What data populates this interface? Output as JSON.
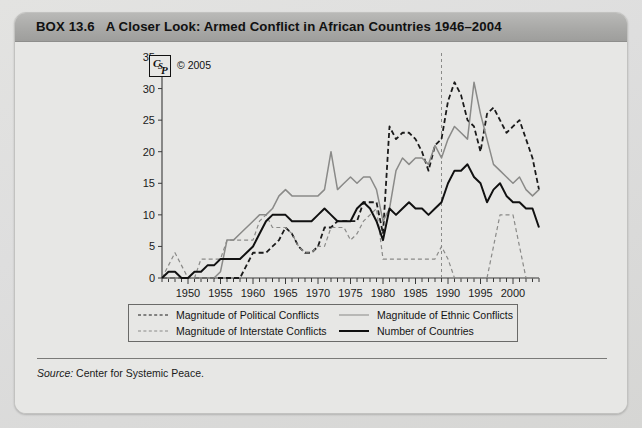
{
  "box": {
    "label": "BOX 13.6",
    "title": "A Closer Look: Armed Conflict in African Countries 1946–2004"
  },
  "logo": {
    "mark_c": "C",
    "mark_s": "S",
    "mark_p": "P",
    "copyright": "© 2005"
  },
  "source": {
    "prefix": "Source:",
    "text": " Center for Systemic Peace."
  },
  "legend": {
    "items": [
      {
        "label": "Magnitude of Political Conflicts",
        "style": "dashed-black"
      },
      {
        "label": "Magnitude of Ethnic Conflicts",
        "style": "solid-gray"
      },
      {
        "label": "Magnitude of Interstate Conflicts",
        "style": "dashed-gray"
      },
      {
        "label": "Number of Countries",
        "style": "solid-black"
      }
    ]
  },
  "colors": {
    "black": "#111111",
    "gray": "#8a8a88",
    "axis": "#3a3a3a",
    "header_band": "#a9a9a7",
    "page_bg": "#e7e7e5"
  },
  "chart_data": {
    "type": "line",
    "xlabel": "",
    "ylabel": "",
    "xlim": [
      1946,
      2004
    ],
    "ylim": [
      0,
      35
    ],
    "yticks": [
      0,
      5,
      10,
      15,
      20,
      25,
      30,
      35
    ],
    "xticks": [
      1950,
      1955,
      1960,
      1965,
      1970,
      1975,
      1980,
      1985,
      1990,
      1995,
      2000
    ],
    "xtick_step_minor": 1,
    "grid": false,
    "legend_position": "below-plot",
    "annotations": [
      {
        "type": "vline",
        "x": 1989,
        "style": "dashed",
        "color": "#8a8a88",
        "label": ""
      }
    ],
    "x": [
      1946,
      1947,
      1948,
      1949,
      1950,
      1951,
      1952,
      1953,
      1954,
      1955,
      1956,
      1957,
      1958,
      1959,
      1960,
      1961,
      1962,
      1963,
      1964,
      1965,
      1966,
      1967,
      1968,
      1969,
      1970,
      1971,
      1972,
      1973,
      1974,
      1975,
      1976,
      1977,
      1978,
      1979,
      1980,
      1981,
      1982,
      1983,
      1984,
      1985,
      1986,
      1987,
      1988,
      1989,
      1990,
      1991,
      1992,
      1993,
      1994,
      1995,
      1996,
      1997,
      1998,
      1999,
      2000,
      2001,
      2002,
      2003,
      2004
    ],
    "series": [
      {
        "name": "Magnitude of Political Conflicts",
        "style": "dashed",
        "color": "#1a1a1a",
        "width": 1.8,
        "values": [
          0,
          0,
          0,
          0,
          0,
          0,
          0,
          0,
          0,
          0,
          0,
          0,
          0,
          2,
          4,
          4,
          4,
          5,
          6,
          8,
          7,
          5,
          4,
          4,
          5,
          8,
          8,
          9,
          9,
          9,
          9,
          12,
          12,
          12,
          7,
          24,
          22,
          23,
          23,
          22,
          20,
          17,
          21,
          22,
          28,
          31,
          29,
          25,
          24,
          20,
          26,
          27,
          25,
          23,
          24,
          25,
          22,
          19,
          14
        ]
      },
      {
        "name": "Magnitude of Ethnic Conflicts",
        "style": "solid",
        "color": "#8a8a88",
        "width": 1.5,
        "values": [
          0,
          0,
          0,
          0,
          0,
          0,
          0,
          0,
          0,
          1,
          6,
          6,
          7,
          8,
          9,
          10,
          10,
          11,
          13,
          14,
          13,
          13,
          13,
          13,
          13,
          14,
          20,
          14,
          15,
          16,
          15,
          16,
          16,
          14,
          9,
          11,
          17,
          19,
          18,
          19,
          19,
          18,
          21,
          19,
          22,
          24,
          23,
          22,
          31,
          26,
          22,
          18,
          17,
          16,
          15,
          16,
          14,
          13,
          14
        ]
      },
      {
        "name": "Magnitude of Interstate Conflicts",
        "style": "dashed",
        "color": "#8a8a88",
        "width": 1.2,
        "values": [
          0,
          2,
          4,
          2,
          0,
          0,
          3,
          3,
          3,
          3,
          6,
          6,
          6,
          6,
          6,
          9,
          10,
          8,
          8,
          8,
          7,
          5,
          4,
          4,
          5,
          5,
          8,
          8,
          8,
          6,
          7,
          9,
          10,
          11,
          3,
          3,
          3,
          3,
          3,
          3,
          3,
          3,
          3,
          5,
          3,
          0,
          0,
          0,
          0,
          0,
          0,
          5,
          10,
          10,
          10,
          5,
          0,
          0,
          0
        ]
      },
      {
        "name": "Number of Countries",
        "style": "solid",
        "color": "#111111",
        "width": 2.0,
        "values": [
          0,
          1,
          1,
          0,
          0,
          1,
          1,
          2,
          2,
          3,
          3,
          3,
          3,
          4,
          5,
          7,
          9,
          10,
          10,
          10,
          9,
          9,
          9,
          9,
          10,
          11,
          10,
          9,
          9,
          9,
          11,
          12,
          11,
          9,
          6,
          11,
          10,
          11,
          12,
          11,
          11,
          10,
          11,
          12,
          15,
          17,
          17,
          18,
          16,
          15,
          12,
          14,
          15,
          13,
          12,
          12,
          11,
          11,
          8
        ]
      }
    ]
  }
}
